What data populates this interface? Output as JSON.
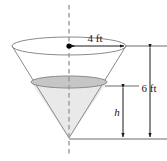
{
  "figure": {
    "name": "inverted-cone-water-tank",
    "background_color": "#ffffff"
  },
  "labels": {
    "radius": "4 ft",
    "total_height": "6 ft",
    "water_depth": "h"
  },
  "colors": {
    "outline": "#808080",
    "dimension_line": "#4d4d4d",
    "axis_dashed": "#999999",
    "water_fill": "#e9e9e9",
    "surface_fill": "#c6c6c6",
    "top_ellipse_fill": "#ffffff",
    "center_dot": "#000000",
    "text": "#1a1a1a"
  },
  "geometry": {
    "cone_apex_x": 69,
    "cone_apex_y": 138,
    "top_ellipse_cx": 69,
    "top_ellipse_cy": 46,
    "top_ellipse_rx": 57,
    "top_ellipse_ry": 9,
    "water_ellipse_cx": 69,
    "water_ellipse_cy": 82,
    "water_ellipse_rx": 38,
    "water_ellipse_ry": 6,
    "axis_top_y": 5,
    "axis_bottom_y": 156,
    "total_height_value": 6,
    "radius_value": 4,
    "units": "ft"
  }
}
